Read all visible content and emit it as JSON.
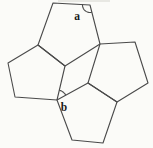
{
  "figure": {
    "width": 153,
    "height": 148,
    "background": "#fbfbf8",
    "stroke_color": "#4a4a4a",
    "stroke_width": 1.1,
    "polygons": [
      {
        "name": "top-pentagon",
        "points": [
          [
            53,
            3
          ],
          [
            90,
            5
          ],
          [
            100,
            44
          ],
          [
            65,
            66
          ],
          [
            38,
            45
          ]
        ]
      },
      {
        "name": "left-pentagon",
        "points": [
          [
            38,
            45
          ],
          [
            65,
            66
          ],
          [
            57,
            100
          ],
          [
            15,
            97
          ],
          [
            8,
            63
          ]
        ]
      },
      {
        "name": "right-pentagon",
        "points": [
          [
            100,
            44
          ],
          [
            135,
            42
          ],
          [
            148,
            83
          ],
          [
            117,
            102
          ],
          [
            88,
            83
          ]
        ]
      },
      {
        "name": "bottom-pentagon",
        "points": [
          [
            57,
            100
          ],
          [
            88,
            83
          ],
          [
            117,
            102
          ],
          [
            103,
            143
          ],
          [
            72,
            140
          ]
        ]
      }
    ],
    "angle_marks": [
      {
        "name": "angle-a-arc",
        "vertex": [
          90,
          5
        ],
        "ray1": [
          53,
          3
        ],
        "ray2": [
          100,
          44
        ],
        "radius": 7.5
      },
      {
        "name": "angle-b-arc",
        "vertex": [
          57,
          100
        ],
        "ray1": [
          65,
          66
        ],
        "ray2": [
          88,
          83
        ],
        "radius": 10
      }
    ],
    "labels": [
      {
        "name": "angle-a-label",
        "text": "a",
        "x": 77,
        "y": 20
      },
      {
        "name": "angle-b-label",
        "text": "b",
        "x": 64,
        "y": 111
      }
    ],
    "artifacts": [
      {
        "name": "scan-smudge",
        "x": 58,
        "y": 0,
        "w": 52,
        "h": 2,
        "color": "#d9d9d2",
        "opacity": 0.55
      }
    ]
  }
}
